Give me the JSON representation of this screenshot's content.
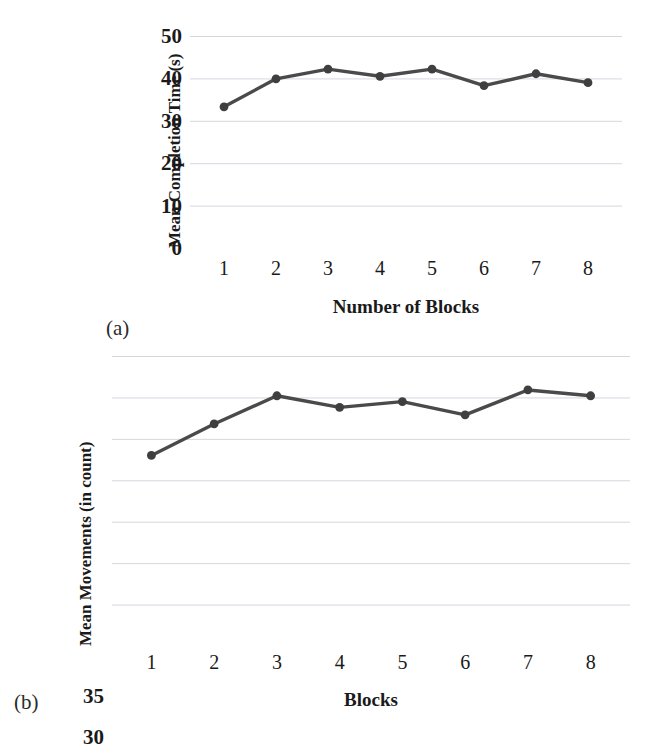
{
  "figure": {
    "background": "#ffffff",
    "line_color": "#4a4a4a",
    "marker_color": "#3f3f3f",
    "grid_color": "#c8ccd6"
  },
  "panels": [
    {
      "id": "a",
      "caption": "(a)",
      "chart_data": {
        "type": "line",
        "title": "",
        "xlabel": "Number of Blocks",
        "ylabel": "Mean Completion Time (s)",
        "categories": [
          "1",
          "2",
          "3",
          "4",
          "5",
          "6",
          "7",
          "8"
        ],
        "x": [
          1,
          2,
          3,
          4,
          5,
          6,
          7,
          8
        ],
        "values": [
          33.3,
          39.9,
          42.2,
          40.5,
          42.2,
          38.3,
          41.1,
          39.0
        ],
        "ylim": [
          0,
          50
        ],
        "yticks": [
          "50",
          "40",
          "30",
          "20",
          "10",
          "0"
        ],
        "ytick_values": [
          50,
          40,
          30,
          20,
          10,
          0
        ],
        "xticks": [
          "1",
          "2",
          "3",
          "4",
          "5",
          "6",
          "7",
          "8"
        ],
        "grid": "horizontal",
        "legend": "none",
        "markers": "filled-circle"
      }
    },
    {
      "id": "b",
      "caption": "(b)",
      "chart_data": {
        "type": "line",
        "title": "",
        "xlabel": "Blocks",
        "ylabel": "Mean Movements (in count)",
        "categories": [
          "1",
          "2",
          "3",
          "4",
          "5",
          "6",
          "7",
          "8"
        ],
        "x": [
          1,
          2,
          3,
          4,
          5,
          6,
          7,
          8
        ],
        "values": [
          23.0,
          26.8,
          30.2,
          28.8,
          29.5,
          27.9,
          30.9,
          30.2
        ],
        "ylim": [
          0,
          35
        ],
        "yticks": [
          "35",
          "30",
          "25",
          "20",
          "15",
          "10",
          "5",
          "0"
        ],
        "ytick_values": [
          35,
          30,
          25,
          20,
          15,
          10,
          5,
          0
        ],
        "xticks": [
          "1",
          "2",
          "3",
          "4",
          "5",
          "6",
          "7",
          "8"
        ],
        "grid": "horizontal",
        "legend": "none",
        "markers": "filled-circle"
      }
    }
  ]
}
